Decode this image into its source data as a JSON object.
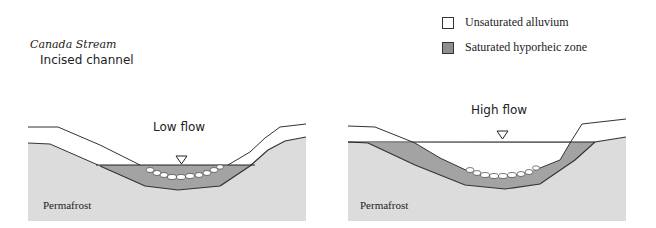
{
  "title": "Canada Stream",
  "subtitle": "Incised channel",
  "legend": [
    {
      "label": "Unsaturated alluvium",
      "fill": "#ffffff"
    },
    {
      "label": "Saturated hyporheic zone",
      "fill": "#8f8f8f"
    }
  ],
  "panels": [
    {
      "label": "Low flow",
      "ground_label": "Permafrost",
      "water_symbol": "triangle-down"
    },
    {
      "label": "High flow",
      "ground_label": "Permafrost",
      "water_symbol": "triangle-down"
    }
  ],
  "colors": {
    "permafrost": "#dcdcdc",
    "hyporheic": "#a3a3a3",
    "line": "#333333"
  }
}
